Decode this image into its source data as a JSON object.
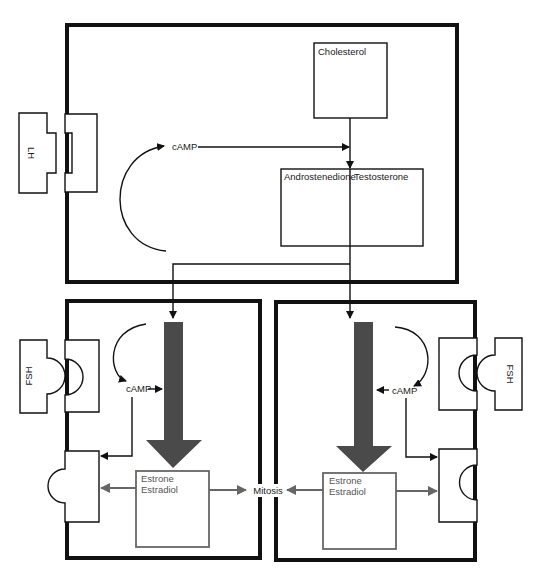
{
  "colors": {
    "outline": "#111111",
    "estrogen_arrow": "#555555",
    "estrogen_box": "#666666",
    "background": "#ffffff"
  },
  "theca_cell": {
    "hormone_label": "LH",
    "second_messenger": "cAMP",
    "precursor_box": {
      "label": "Cholesterol"
    },
    "androgen_box": {
      "label_left": "Androstenedione",
      "label_right": "Testosterone"
    }
  },
  "granulosa_left": {
    "hormone_label": "FSH",
    "second_messenger": "cAMP",
    "estrogen_box": {
      "line1": "Estrone",
      "line2": "Estradiol"
    }
  },
  "granulosa_right": {
    "hormone_label": "FSH",
    "second_messenger": "cAMP",
    "estrogen_box": {
      "line1": "Estrone",
      "line2": "Estradiol"
    }
  },
  "center_label": "Mitosis"
}
